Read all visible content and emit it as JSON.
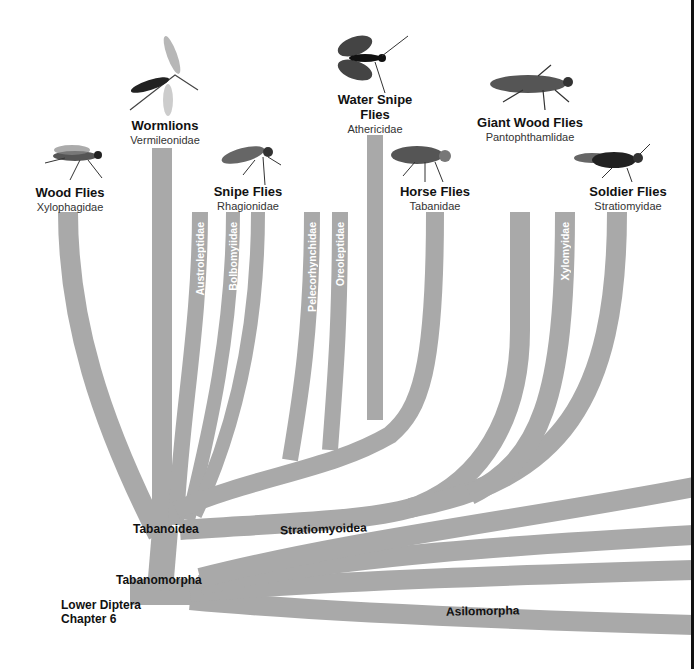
{
  "diagram": {
    "type": "phylogenetic-tree",
    "branch_color": "#a9a9a9",
    "root": {
      "label_line1": "Lower Diptera",
      "label_line2": "Chapter 6"
    },
    "nodes": {
      "tabanomorpha": "Tabanomorpha",
      "tabanoidea": "Tabanoidea",
      "stratiomyoidea": "Stratiomyoidea",
      "asilomorpha": "Asilomorpha"
    },
    "taxa": [
      {
        "common": "Wood Flies",
        "scientific": "Xylophagidae",
        "icon": "wood-fly-icon"
      },
      {
        "common": "Wormlions",
        "scientific": "Vermileonidae",
        "icon": "wormlion-icon"
      },
      {
        "common": "Snipe Flies",
        "scientific": "Rhagionidae",
        "icon": "snipe-fly-icon"
      },
      {
        "common": "Water Snipe Flies",
        "scientific": "Athericidae",
        "icon": "water-snipe-fly-icon"
      },
      {
        "common": "Horse Flies",
        "scientific": "Tabanidae",
        "icon": "horse-fly-icon"
      },
      {
        "common": "Giant Wood Flies",
        "scientific": "Pantophthamlidae",
        "icon": "giant-wood-fly-icon"
      },
      {
        "common": "Soldier Flies",
        "scientific": "Stratiomyidae",
        "icon": "soldier-fly-icon"
      }
    ],
    "minor_families": [
      "Austroleptidae",
      "Bolbomyiidae",
      "Pelecorhynchidae",
      "Oreoleptidae",
      "Xylomyidae"
    ]
  }
}
